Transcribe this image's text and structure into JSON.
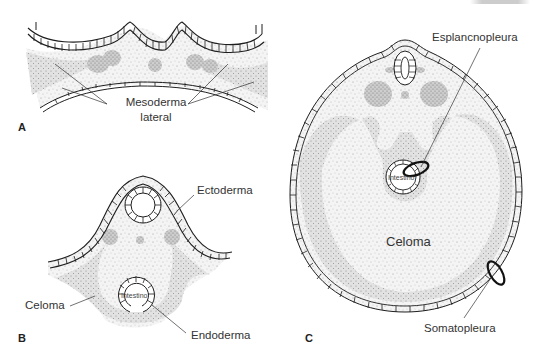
{
  "figure": {
    "panels": [
      {
        "id": "A",
        "letter": "A",
        "labels": {
          "mesoderm_line1": "Mesoderma",
          "mesoderm_line2": "lateral"
        }
      },
      {
        "id": "B",
        "letter": "B",
        "labels": {
          "ectoderm": "Ectoderma",
          "coelom": "Celoma",
          "endoderm": "Endoderma",
          "intestine": "Intestino"
        }
      },
      {
        "id": "C",
        "letter": "C",
        "labels": {
          "splanchnopleure": "Esplancnopleura",
          "coelom": "Celoma",
          "somatopleure": "Somatopleura",
          "intestine": "Intestino"
        }
      }
    ],
    "colors": {
      "ink": "#1e1e1e",
      "stipple_light": "#d8d8d8",
      "stipple_dark": "#9c9c9c",
      "background": "#ffffff"
    }
  }
}
